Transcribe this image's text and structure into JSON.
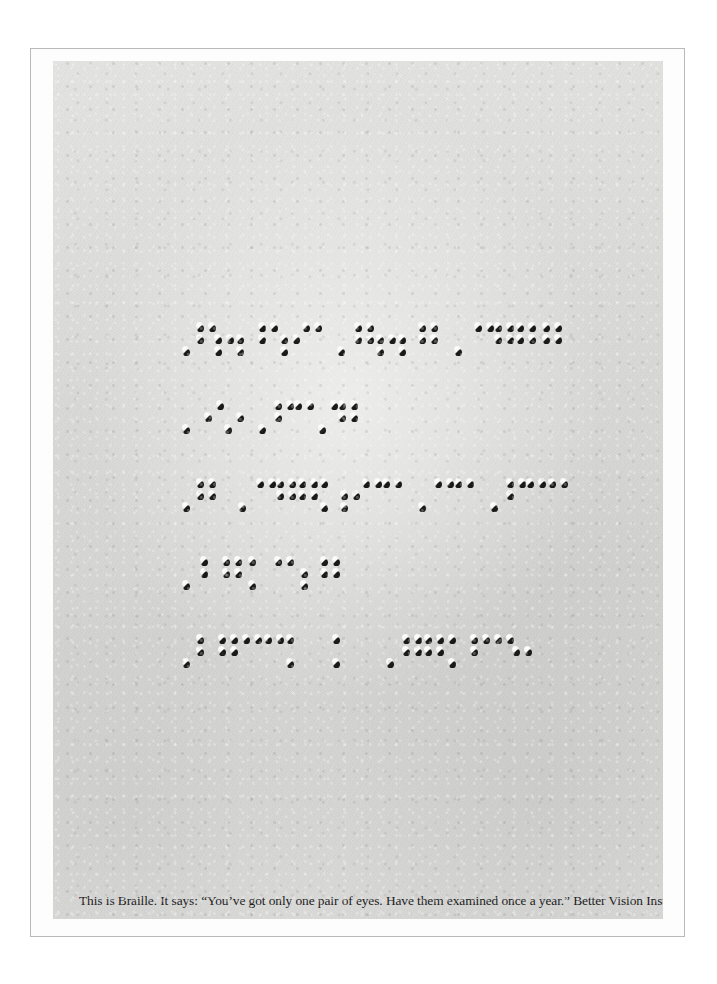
{
  "advertisement": {
    "medium": "embossed braille on paper",
    "caption": "This is Braille. It says: “You’ve got only one pair of eyes. Have them examined once a year.” Better Vision Institute.",
    "advertiser": "Better Vision Institute",
    "quoted_message": "You’ve got only one pair of eyes. Have them examined once a year.",
    "colors": {
      "paper": "#dededc",
      "dot_shadow": "#1a1a1a",
      "dot_highlight": "#ffffff",
      "frame_border": "#b9b9b9",
      "caption_text": "#1c1c1c",
      "page_background": "#ffffff"
    }
  },
  "braille": {
    "line_count": 5,
    "lines": [
      {
        "index": 1,
        "cells": [
          {
            "x": 0,
            "dots": [
              3
            ]
          },
          {
            "x": 14,
            "dots": [
              1,
              2,
              4
            ]
          },
          {
            "x": 32,
            "dots": [
              2,
              3,
              5
            ]
          },
          {
            "x": 54,
            "dots": [
              2,
              3
            ]
          },
          {
            "x": 76,
            "dots": [
              1,
              2,
              4
            ]
          },
          {
            "x": 98,
            "dots": [
              2,
              3,
              5
            ]
          },
          {
            "x": 120,
            "dots": [
              1,
              4
            ]
          },
          {
            "x": 155,
            "dots": [
              3
            ]
          },
          {
            "x": 172,
            "dots": [
              1,
              2,
              4,
              5
            ]
          },
          {
            "x": 194,
            "dots": [
              2,
              3,
              5
            ]
          },
          {
            "x": 216,
            "dots": [
              2,
              3
            ]
          },
          {
            "x": 236,
            "dots": [
              1,
              2,
              4,
              5
            ]
          },
          {
            "x": 272,
            "dots": [
              3
            ]
          },
          {
            "x": 292,
            "dots": [
              1,
              4
            ]
          },
          {
            "x": 312,
            "dots": [
              1,
              2,
              4,
              5
            ]
          },
          {
            "x": 334,
            "dots": [
              1,
              2,
              4,
              5
            ]
          },
          {
            "x": 360,
            "dots": [
              1,
              2,
              4,
              5
            ]
          }
        ]
      },
      {
        "index": 2,
        "cells": [
          {
            "x": 0,
            "dots": [
              3
            ]
          },
          {
            "x": 22,
            "dots": [
              2,
              4
            ]
          },
          {
            "x": 42,
            "dots": [
              3,
              5
            ]
          },
          {
            "x": 76,
            "dots": [
              3
            ]
          },
          {
            "x": 92,
            "dots": [
              1,
              2,
              4
            ]
          },
          {
            "x": 112,
            "dots": [
              1,
              4
            ]
          },
          {
            "x": 136,
            "dots": [
              3,
              4
            ]
          },
          {
            "x": 156,
            "dots": [
              1,
              2,
              4,
              5
            ]
          }
        ]
      },
      {
        "index": 3,
        "cells": [
          {
            "x": 0,
            "dots": [
              3
            ]
          },
          {
            "x": 14,
            "dots": [
              1,
              2,
              4,
              5
            ]
          },
          {
            "x": 56,
            "dots": [
              3
            ]
          },
          {
            "x": 74,
            "dots": [
              1,
              4
            ]
          },
          {
            "x": 94,
            "dots": [
              1,
              2,
              4,
              5
            ]
          },
          {
            "x": 116,
            "dots": [
              1,
              2,
              4,
              5
            ]
          },
          {
            "x": 138,
            "dots": [
              1,
              3
            ]
          },
          {
            "x": 158,
            "dots": [
              2,
              3,
              5
            ]
          },
          {
            "x": 180,
            "dots": [
              1,
              4
            ]
          },
          {
            "x": 200,
            "dots": [
              1,
              4
            ]
          },
          {
            "x": 236,
            "dots": [
              3
            ]
          },
          {
            "x": 252,
            "dots": [
              1,
              4
            ]
          },
          {
            "x": 272,
            "dots": [
              1,
              4
            ]
          },
          {
            "x": 308,
            "dots": [
              3
            ]
          },
          {
            "x": 324,
            "dots": [
              1,
              2,
              4
            ]
          },
          {
            "x": 344,
            "dots": [
              1,
              4
            ]
          },
          {
            "x": 366,
            "dots": [
              1,
              4
            ]
          }
        ]
      },
      {
        "index": 4,
        "cells": [
          {
            "x": 0,
            "dots": [
              3
            ]
          },
          {
            "x": 18,
            "dots": [
              1,
              2
            ]
          },
          {
            "x": 40,
            "dots": [
              1,
              2,
              4,
              5
            ]
          },
          {
            "x": 66,
            "dots": [
              1,
              3
            ]
          },
          {
            "x": 92,
            "dots": [
              1,
              4
            ]
          },
          {
            "x": 118,
            "dots": [
              2,
              3
            ]
          },
          {
            "x": 138,
            "dots": [
              1,
              2,
              4,
              5
            ]
          }
        ]
      },
      {
        "index": 5,
        "cells": [
          {
            "x": 0,
            "dots": [
              3
            ]
          },
          {
            "x": 14,
            "dots": [
              1,
              2
            ]
          },
          {
            "x": 36,
            "dots": [
              1,
              2,
              4,
              5
            ]
          },
          {
            "x": 60,
            "dots": [
              1,
              4
            ]
          },
          {
            "x": 82,
            "dots": [
              1,
              4
            ]
          },
          {
            "x": 104,
            "dots": [
              1,
              3
            ]
          },
          {
            "x": 150,
            "dots": [
              1,
              3
            ]
          },
          {
            "x": 204,
            "dots": [
              3
            ]
          },
          {
            "x": 220,
            "dots": [
              1,
              2,
              4,
              5
            ]
          },
          {
            "x": 242,
            "dots": [
              1,
              2,
              4,
              5
            ]
          },
          {
            "x": 266,
            "dots": [
              1,
              3
            ]
          },
          {
            "x": 288,
            "dots": [
              1,
              2,
              4
            ]
          },
          {
            "x": 312,
            "dots": [
              1,
              4
            ]
          },
          {
            "x": 330,
            "dots": [
              2,
              5
            ]
          }
        ]
      }
    ]
  }
}
